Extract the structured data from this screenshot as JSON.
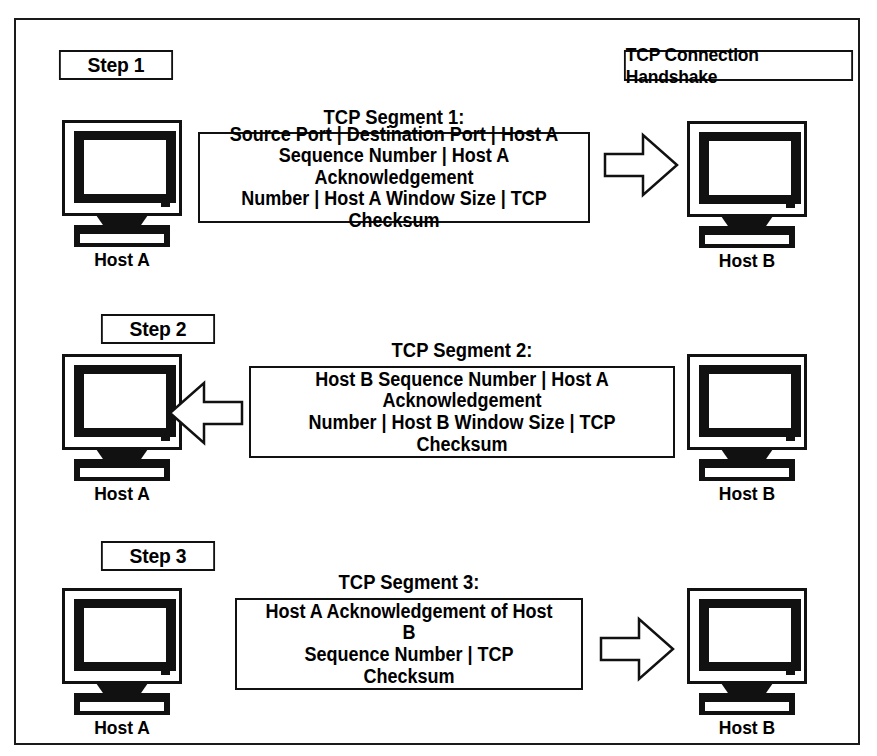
{
  "title": "TCP Connection Handshake",
  "hosts": {
    "a": "Host A",
    "b": "Host B"
  },
  "steps": [
    {
      "label": "Step 1",
      "caption": "TCP Segment 1:",
      "direction": "right",
      "lines": [
        "Source Port | Destination Port | Host A",
        "Sequence Number | Host A Acknowledgement",
        "Number | Host A Window Size | TCP Checksum"
      ]
    },
    {
      "label": "Step 2",
      "caption": "TCP Segment 2:",
      "direction": "left",
      "lines": [
        "Host B Sequence Number | Host A Acknowledgement",
        "Number | Host B Window Size | TCP Checksum"
      ]
    },
    {
      "label": "Step 3",
      "caption": "TCP Segment 3:",
      "direction": "right",
      "lines": [
        "Host A Acknowledgement of Host B",
        "Sequence Number | TCP Checksum"
      ]
    }
  ],
  "colors": {
    "ink": "#111111",
    "paper": "#ffffff"
  }
}
